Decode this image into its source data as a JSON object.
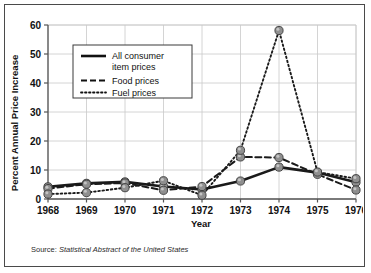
{
  "chart_data": {
    "type": "line",
    "title": "",
    "xlabel": "Year",
    "ylabel": "Percent Annual Price Increase",
    "categories": [
      "1968",
      "1969",
      "1970",
      "1971",
      "1972",
      "1973",
      "1974",
      "1975",
      "1976"
    ],
    "x": [
      1968,
      1969,
      1970,
      1971,
      1972,
      1973,
      1974,
      1975,
      1976
    ],
    "xlim": [
      1968,
      1976
    ],
    "ylim": [
      0,
      60
    ],
    "yticks": [
      0,
      10,
      20,
      30,
      40,
      50,
      60
    ],
    "grid": true,
    "legend_position": "upper-left-inside",
    "series": [
      {
        "name": "All consumer item prices",
        "style": "solid",
        "values": [
          4.2,
          5.4,
          5.9,
          4.3,
          3.3,
          6.2,
          11.0,
          9.1,
          5.8
        ]
      },
      {
        "name": "Food prices",
        "style": "dashed",
        "values": [
          3.6,
          5.1,
          5.5,
          3.0,
          4.3,
          14.5,
          14.3,
          8.5,
          3.1
        ]
      },
      {
        "name": "Fuel prices",
        "style": "dotted",
        "values": [
          1.7,
          2.2,
          3.9,
          6.3,
          1.3,
          16.8,
          58.1,
          9.3,
          7.0
        ]
      }
    ]
  },
  "axes": {
    "y_title": "Percent Annual Price Increase",
    "x_title": "Year",
    "y_ticks": [
      "0",
      "10",
      "20",
      "30",
      "40",
      "50",
      "60"
    ],
    "x_ticks": [
      "1968",
      "1969",
      "1970",
      "1971",
      "1972",
      "1973",
      "1974",
      "1975",
      "1976"
    ]
  },
  "legend": {
    "entries": [
      {
        "label_line1": "All consumer",
        "label_line2": "item prices",
        "style": "solid"
      },
      {
        "label_line1": "Food prices",
        "label_line2": "",
        "style": "dashed"
      },
      {
        "label_line1": "Fuel prices",
        "label_line2": "",
        "style": "dotted"
      }
    ]
  },
  "source": {
    "prefix": "Source: ",
    "citation": "Statistical Abstract of the United States"
  },
  "colors": {
    "frame": "#4a4a4a",
    "line": "#1a1a1a",
    "marker_fill": "#8f8f8f",
    "marker_stroke": "#3a3a3a",
    "grid": "#c9c9c9",
    "axis": "#555555",
    "background": "#ffffff"
  }
}
